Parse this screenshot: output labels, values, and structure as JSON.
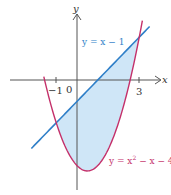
{
  "chart_data": {
    "type": "line",
    "title": "",
    "xlabel": "x",
    "ylabel": "y",
    "x_ticks": [
      "-1",
      "0",
      "3"
    ],
    "series": [
      {
        "name": "y = x − 1",
        "color": "#2f7fc8",
        "expr": "x-1",
        "x_range": [
          -2.2,
          3.5
        ]
      },
      {
        "name": "y = x² − x − 4",
        "color": "#c4306a",
        "expr": "x^2-x-4",
        "x_range": [
          -1.6,
          3.15
        ]
      }
    ],
    "shaded_region": {
      "between": [
        "y = x − 1",
        "y = x² − x − 4"
      ],
      "x_range": [
        -1,
        3
      ],
      "color": "#cfe6f7"
    },
    "intersections": [
      [
        -1,
        -2
      ],
      [
        3,
        2
      ]
    ],
    "grid": false,
    "legend": "inline labels"
  },
  "labels": {
    "y_axis": "y",
    "x_axis": "x",
    "tick_neg1": "−1",
    "origin": "0",
    "tick_3": "3",
    "line_label": "y = x − 1",
    "parabola_label_prefix": "y = x",
    "parabola_label_exp": "2",
    "parabola_label_suffix": " − x − 4"
  }
}
